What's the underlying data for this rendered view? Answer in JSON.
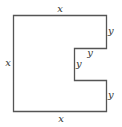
{
  "diagram": {
    "stroke_color": "#555555",
    "label_color": "#333333",
    "labels": {
      "top": "x",
      "left": "x",
      "bottom": "x",
      "right_upper": "y",
      "notch_top": "y",
      "notch_inner": "y",
      "right_lower": "y"
    }
  }
}
